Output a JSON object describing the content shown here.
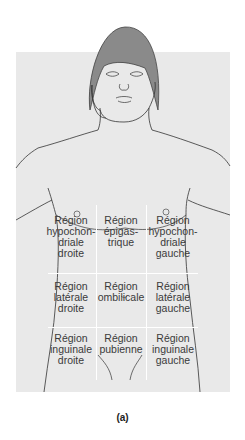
{
  "figure": {
    "caption": "(a)",
    "colors": {
      "background": "#ffffff",
      "panel": "#e9e9e9",
      "hair": "#8a8a8a",
      "outline": "#333333",
      "grid": "#ffffff",
      "text": "#3a3a3a"
    }
  },
  "regions": [
    {
      "row": 1,
      "col": 1,
      "lines": [
        "Région",
        "hypochon-",
        "driale",
        "droite"
      ]
    },
    {
      "row": 1,
      "col": 2,
      "lines": [
        "Région",
        "épigas-",
        "trique"
      ]
    },
    {
      "row": 1,
      "col": 3,
      "lines": [
        "Région",
        "hypochon-",
        "driale",
        "gauche"
      ]
    },
    {
      "row": 2,
      "col": 1,
      "lines": [
        "Région",
        "latérale",
        "droite"
      ]
    },
    {
      "row": 2,
      "col": 2,
      "lines": [
        "Région",
        "ombilicale"
      ]
    },
    {
      "row": 2,
      "col": 3,
      "lines": [
        "Région",
        "latérale",
        "gauche"
      ]
    },
    {
      "row": 3,
      "col": 1,
      "lines": [
        "Région",
        "inguinale",
        "droite"
      ]
    },
    {
      "row": 3,
      "col": 2,
      "lines": [
        "Région",
        "pubienne"
      ]
    },
    {
      "row": 3,
      "col": 3,
      "lines": [
        "Région",
        "inguinale",
        "gauche"
      ]
    }
  ],
  "labels": {
    "r1c1": "Région\nhypochon-\ndriale\ndroite",
    "r1c2": "Région\népigas-\ntrique",
    "r1c3": "Région\nhypochon-\ndriale\ngauche",
    "r2c1": "Région\nlatérale\ndroite",
    "r2c2": "Région\nombilicale",
    "r2c3": "Région\nlatérale\ngauche",
    "r3c1": "Région\ninguinale\ndroite",
    "r3c2": "Région\npubienne",
    "r3c3": "Région\ninguinale\ngauche"
  }
}
